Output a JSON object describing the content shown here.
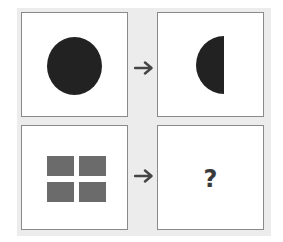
{
  "puzzle": {
    "type": "analogy",
    "rows": [
      {
        "source": {
          "shape": "circle",
          "fill": "#222222",
          "label": "filled circle"
        },
        "arrow": "right-arrow",
        "result": {
          "shape": "left-half-circle",
          "fill": "#222222",
          "label": "left half of circle"
        }
      },
      {
        "source": {
          "shape": "four-squares-grid",
          "fill": "#6b6b6b",
          "count": 4,
          "label": "2x2 grid of squares"
        },
        "arrow": "right-arrow",
        "result": {
          "shape": "unknown",
          "text": "?"
        }
      }
    ],
    "colors": {
      "background": "#ececec",
      "panel": "#ffffff",
      "panel_border": "#8a8a8a",
      "arrow": "#444444"
    }
  }
}
